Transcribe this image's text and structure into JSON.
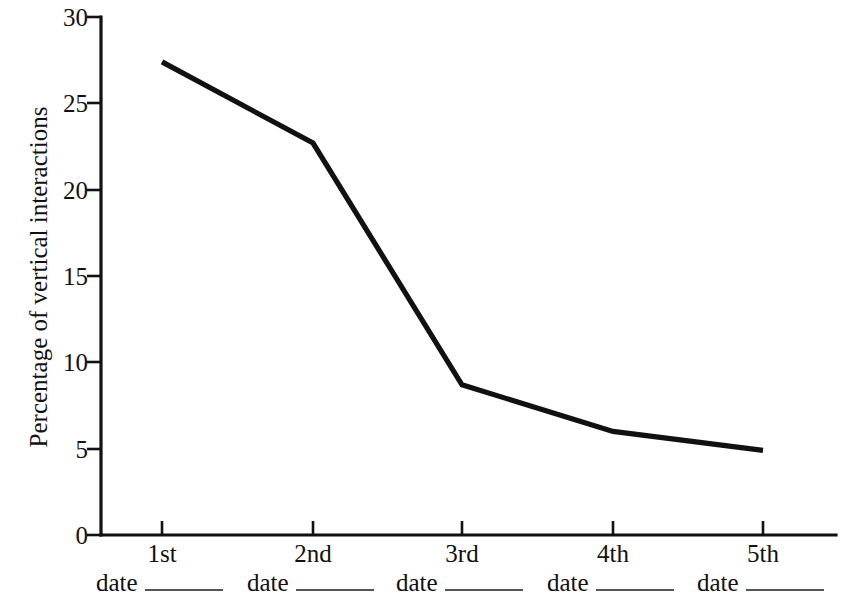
{
  "chart_data": {
    "type": "line",
    "title": "",
    "xlabel": "",
    "ylabel": "Percentage of vertical interactions",
    "categories": [
      "1st",
      "2nd",
      "3rd",
      "4th",
      "5th"
    ],
    "category_sublabels": [
      "date",
      "date",
      "date",
      "date",
      "date"
    ],
    "values": [
      27.4,
      22.7,
      8.7,
      6.0,
      4.9
    ],
    "series": [
      {
        "name": "Percentage of vertical interactions",
        "values": [
          27.4,
          22.7,
          8.7,
          6.0,
          4.9
        ]
      }
    ],
    "ylim": [
      0,
      30
    ],
    "yticks": [
      0,
      5,
      10,
      15,
      20,
      25,
      30
    ],
    "ytick_labels": [
      "0",
      "5",
      "10",
      "15",
      "20",
      "25",
      "30"
    ],
    "xtick_labels": [
      "1st",
      "2nd",
      "3rd",
      "4th",
      "5th"
    ],
    "grid": false,
    "legend": false,
    "legend_position": "none",
    "line_color": "#111111",
    "background_color": "#ffffff",
    "blank_fill_label": "date"
  },
  "axes": {
    "y_title": "Percentage of vertical interactions",
    "y_labels": {
      "t30": "30",
      "t25": "25",
      "t20": "20",
      "t15": "15",
      "t10": "10",
      "t5": "5",
      "t0": "0"
    },
    "x_labels": {
      "c1": "1st",
      "c2": "2nd",
      "c3": "3rd",
      "c4": "4th",
      "c5": "5th"
    },
    "date_labels": {
      "d1": "date",
      "d2": "date",
      "d3": "date",
      "d4": "date",
      "d5": "date"
    }
  }
}
